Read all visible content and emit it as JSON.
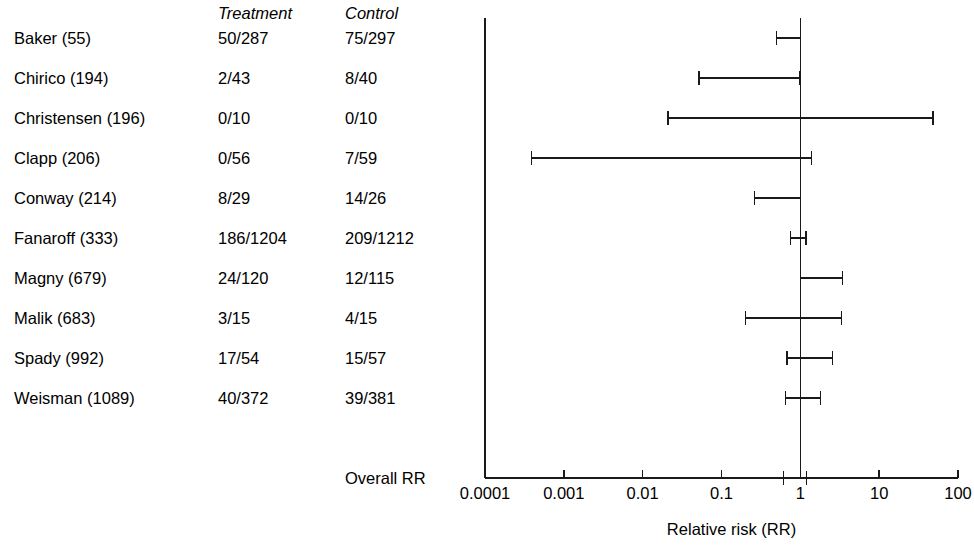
{
  "table": {
    "headers": {
      "study": "",
      "treatment": "Treatment",
      "control": "Control"
    },
    "rows": [
      {
        "study": "Baker (55)",
        "treatment": "50/287",
        "control": "75/297"
      },
      {
        "study": "Chirico (194)",
        "treatment": "2/43",
        "control": "8/40"
      },
      {
        "study": "Christensen (196)",
        "treatment": "0/10",
        "control": "0/10"
      },
      {
        "study": "Clapp (206)",
        "treatment": "0/56",
        "control": "7/59"
      },
      {
        "study": "Conway (214)",
        "treatment": "8/29",
        "control": "14/26"
      },
      {
        "study": "Fanaroff (333)",
        "treatment": "186/1204",
        "control": "209/1212"
      },
      {
        "study": "Magny (679)",
        "treatment": "24/120",
        "control": "12/115"
      },
      {
        "study": "Malik (683)",
        "treatment": "3/15",
        "control": "4/15"
      },
      {
        "study": "Spady (992)",
        "treatment": "17/54",
        "control": "15/57"
      },
      {
        "study": "Weisman (1089)",
        "treatment": "40/372",
        "control": "39/381"
      }
    ],
    "overall_label": "Overall RR"
  },
  "chart_data": {
    "type": "forest",
    "title": "",
    "xlabel": "Relative risk (RR)",
    "ylabel": "",
    "xscale": "log",
    "xlim": [
      0.0001,
      100
    ],
    "xticks": [
      0.0001,
      0.001,
      0.01,
      0.1,
      1,
      10,
      100
    ],
    "xtick_labels": [
      "0.0001",
      "0.001",
      "0.01",
      "0.1",
      "1",
      "10",
      "100"
    ],
    "grid": false,
    "legend": "none",
    "null_line": 1,
    "marker_style": "whisker-bar",
    "line_color": "#1a1a1a",
    "studies": [
      {
        "label": "Baker (55)",
        "rr": 0.69,
        "ci_low": 0.5,
        "ci_high": 1.0
      },
      {
        "label": "Chirico (194)",
        "rr": 0.23,
        "ci_low": 0.052,
        "ci_high": 0.99
      },
      {
        "label": "Christensen (196)",
        "rr": 1.0,
        "ci_low": 0.021,
        "ci_high": 48.0
      },
      {
        "label": "Clapp (206)",
        "rr": 0.067,
        "ci_low": 0.00039,
        "ci_high": 1.38
      },
      {
        "label": "Conway (214)",
        "rr": 0.51,
        "ci_low": 0.26,
        "ci_high": 1.0
      },
      {
        "label": "Fanaroff (333)",
        "rr": 0.9,
        "ci_low": 0.75,
        "ci_high": 1.18
      },
      {
        "label": "Magny (679)",
        "rr": 1.0,
        "ci_low": 1.0,
        "ci_high": 3.45
      },
      {
        "label": "Malik (683)",
        "rr": 0.75,
        "ci_low": 0.2,
        "ci_high": 3.3
      },
      {
        "label": "Spady (992)",
        "rr": 0.83,
        "ci_low": 0.68,
        "ci_high": 2.55
      },
      {
        "label": "Weisman (1089)",
        "rr": 1.0,
        "ci_low": 0.65,
        "ci_high": 1.8
      }
    ],
    "overall": {
      "label": "Overall RR",
      "rr": 0.9,
      "ci_low": 0.61,
      "ci_high": 1.2
    }
  },
  "geometry": {
    "axis_left_px": 485,
    "axis_right_px": 958,
    "axis_y_px": 478,
    "null_x_px": 800,
    "row_top_px": 18,
    "row_step_px": 40,
    "tick_len_px": 8,
    "cap_half_px": 7
  }
}
